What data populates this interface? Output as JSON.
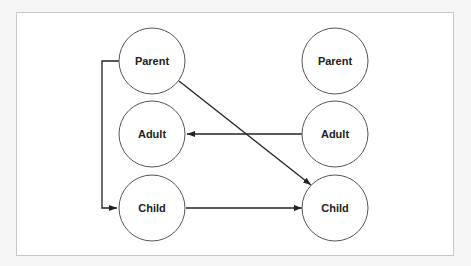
{
  "diagram": {
    "left_column": {
      "parent": "Parent",
      "adult": "Adult",
      "child": "Child"
    },
    "right_column": {
      "parent": "Parent",
      "adult": "Adult",
      "child": "Child"
    },
    "edges": [
      {
        "from": "left.parent",
        "to": "left.child",
        "style": "elbow"
      },
      {
        "from": "left.parent",
        "to": "right.child",
        "style": "diagonal"
      },
      {
        "from": "right.adult",
        "to": "left.adult",
        "style": "straight"
      },
      {
        "from": "left.child",
        "to": "right.child",
        "style": "straight"
      }
    ],
    "colors": {
      "stroke": "#333333",
      "circle_stroke": "#555555",
      "frame_border": "#c8c8c8",
      "background": "#ffffff"
    }
  }
}
